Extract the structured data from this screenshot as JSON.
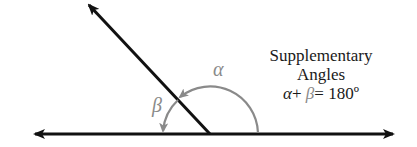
{
  "diagram": {
    "title": "Supplementary Angles",
    "caption_line1": "Supplementary",
    "caption_line2": "Angles",
    "equation": {
      "alpha": "α",
      "plus": "+",
      "beta": "β",
      "equals_value": "= 180º"
    },
    "labels": {
      "alpha": "α",
      "beta": "β"
    },
    "colors": {
      "lines": "#111111",
      "arcs": "#8a8a8a",
      "beta_label": "#8a8a8a",
      "alpha_label": "#8a8a8a",
      "text": "#1a1a1a"
    },
    "geometry": {
      "vertex": [
        210,
        134
      ],
      "line_left": [
        33,
        134
      ],
      "line_right": [
        395,
        134
      ],
      "ray_end": [
        87,
        3
      ]
    }
  }
}
